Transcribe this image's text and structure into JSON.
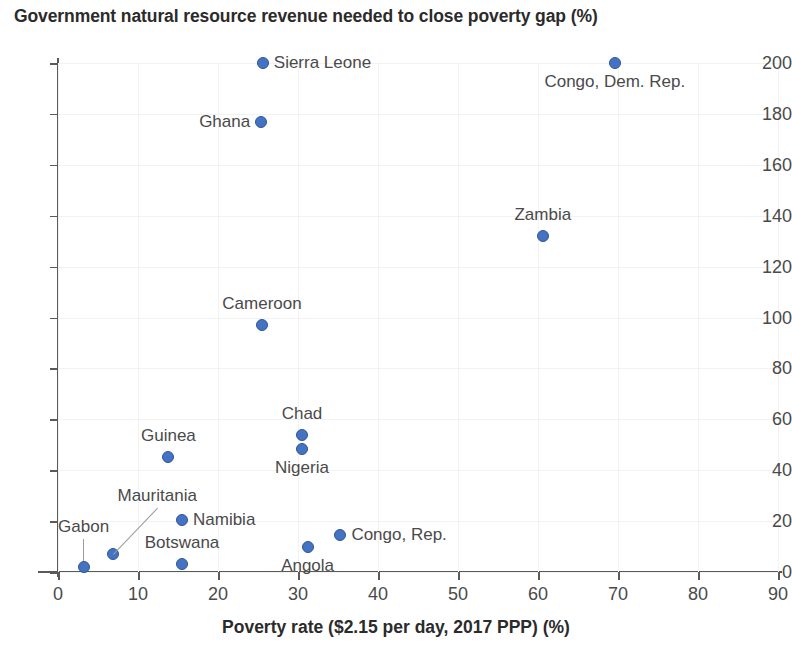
{
  "chart_data": {
    "type": "scatter",
    "title": "Government natural resource revenue needed to close poverty gap (%)",
    "xlabel": "Poverty rate ($2.15 per day, 2017 PPP) (%)",
    "ylabel": "",
    "xlim": [
      0,
      90
    ],
    "ylim": [
      0,
      200
    ],
    "xticks": [
      0,
      10,
      20,
      30,
      40,
      50,
      60,
      70,
      80,
      90
    ],
    "yticks": [
      0,
      20,
      40,
      60,
      80,
      100,
      120,
      140,
      160,
      180,
      200
    ],
    "grid": true,
    "legend": false,
    "marker_color": "#4573c4",
    "marker_edge_color": "#2f5596",
    "points": [
      {
        "name": "Sierra Leone",
        "x": 25.6,
        "y": 200.0,
        "label_pos": "right"
      },
      {
        "name": "Congo, Dem. Rep.",
        "x": 69.6,
        "y": 200.0,
        "label_pos": "below"
      },
      {
        "name": "Ghana",
        "x": 25.4,
        "y": 177.0,
        "label_pos": "left"
      },
      {
        "name": "Zambia",
        "x": 60.6,
        "y": 132.0,
        "label_pos": "above"
      },
      {
        "name": "Cameroon",
        "x": 25.5,
        "y": 97.0,
        "label_pos": "above"
      },
      {
        "name": "Chad",
        "x": 30.5,
        "y": 54.0,
        "label_pos": "above"
      },
      {
        "name": "Nigeria",
        "x": 30.5,
        "y": 48.5,
        "label_pos": "below"
      },
      {
        "name": "Guinea",
        "x": 13.8,
        "y": 45.0,
        "label_pos": "above"
      },
      {
        "name": "Namibia",
        "x": 15.5,
        "y": 20.5,
        "label_pos": "right"
      },
      {
        "name": "Congo, Rep.",
        "x": 35.3,
        "y": 14.5,
        "label_pos": "right"
      },
      {
        "name": "Angola",
        "x": 31.2,
        "y": 10.0,
        "label_pos": "below"
      },
      {
        "name": "Mauritania",
        "x": 6.9,
        "y": 7.0,
        "label_pos": "leader-up-right"
      },
      {
        "name": "Botswana",
        "x": 15.5,
        "y": 3.0,
        "label_pos": "above"
      },
      {
        "name": "Gabon",
        "x": 3.2,
        "y": 2.0,
        "label_pos": "leader-up"
      }
    ]
  }
}
